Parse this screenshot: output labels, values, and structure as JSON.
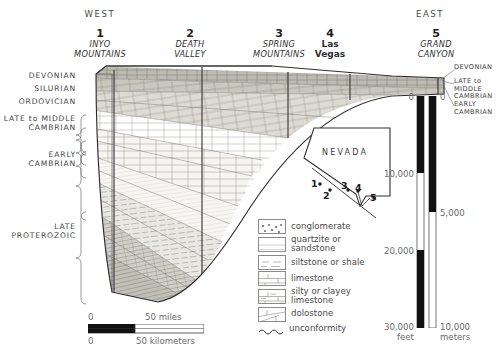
{
  "figure": {
    "type": "geologic-cross-section",
    "orientation": {
      "west": "WEST",
      "east": "EAST"
    }
  },
  "locations": [
    {
      "num": "1",
      "name": "INYO\nMOUNTAINS",
      "city": false
    },
    {
      "num": "2",
      "name": "DEATH\nVALLEY",
      "city": false
    },
    {
      "num": "3",
      "name": "SPRING\nMOUNTAINS",
      "city": false
    },
    {
      "num": "4",
      "name": "Las\nVegas",
      "city": true
    },
    {
      "num": "5",
      "name": "GRAND\nCANYON",
      "city": false
    }
  ],
  "left_periods": [
    {
      "label": "DEVONIAN"
    },
    {
      "label": "SILURIAN"
    },
    {
      "label": "ORDOVICIAN"
    },
    {
      "label": "LATE to MIDDLE\nCAMBRIAN"
    },
    {
      "label": "EARLY\nCAMBRIAN"
    },
    {
      "label": "LATE\nPROTEROZOIC"
    }
  ],
  "right_periods": [
    {
      "label": "DEVONIAN"
    },
    {
      "label": "LATE to\nMIDDLE\nCAMBRIAN"
    },
    {
      "label": "EARLY\nCAMBRIAN"
    }
  ],
  "legend": {
    "items": [
      {
        "pattern": "conglomerate",
        "label": "conglomerate"
      },
      {
        "pattern": "quartzite",
        "label": "quartzite or\nsandstone"
      },
      {
        "pattern": "siltstone",
        "label": "siltstone or shale"
      },
      {
        "pattern": "limestone",
        "label": "limestone"
      },
      {
        "pattern": "silty-limestone",
        "label": "silty or clayey\nlimestone"
      },
      {
        "pattern": "dolostone",
        "label": "dolostone"
      },
      {
        "pattern": "unconformity",
        "label": "unconformity"
      }
    ]
  },
  "inset_map": {
    "state": "NEVADA",
    "points": [
      "1",
      "2",
      "3",
      "4",
      "5"
    ]
  },
  "horizontal_scale": {
    "miles": {
      "zero": "0",
      "max": "50 miles"
    },
    "kilometers": {
      "zero": "0",
      "max": "50 kilometers"
    }
  },
  "vertical_scale": {
    "feet": {
      "ticks": [
        "0",
        "10,000",
        "20,000",
        "30,000"
      ],
      "unit": "feet"
    },
    "meters": {
      "ticks": [
        "0",
        "5,000",
        "10,000"
      ],
      "unit": "meters"
    }
  },
  "colors": {
    "ink": "#2a2a2a",
    "label": "#4a4a4a",
    "rock_light": "#f2f1ee",
    "rock_mid": "#d8d6d0",
    "rock_dark": "#b9b6ae"
  }
}
